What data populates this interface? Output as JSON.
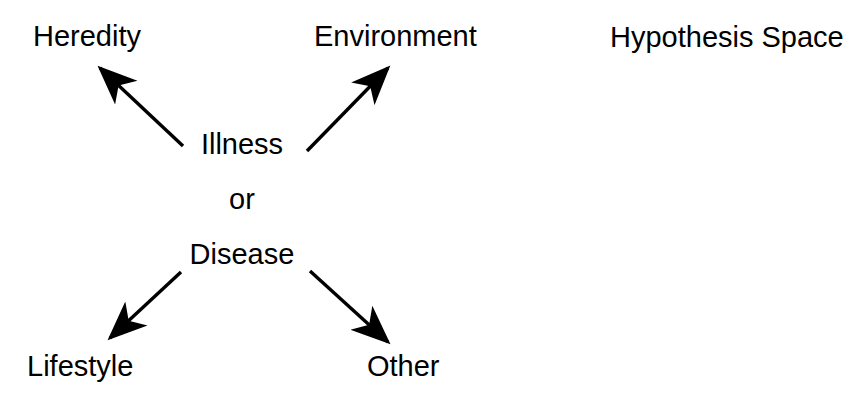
{
  "diagram": {
    "title": "Hypothesis Space",
    "background_color": "#ffffff",
    "ink_color": "#000000",
    "center": {
      "line1": "Illness",
      "line2": "or",
      "line3": "Disease"
    },
    "nodes": [
      {
        "id": "heredity",
        "label": "Heredity",
        "position": "top-left"
      },
      {
        "id": "environment",
        "label": "Environment",
        "position": "top-center"
      },
      {
        "id": "hypothesis",
        "label": "Hypothesis Space",
        "position": "top-right"
      },
      {
        "id": "lifestyle",
        "label": "Lifestyle",
        "position": "bottom-left"
      },
      {
        "id": "other",
        "label": "Other",
        "position": "bottom-right"
      }
    ],
    "arrows": [
      {
        "id": "illness-to-heredity",
        "from": "Illness or Disease",
        "to": "Heredity",
        "direction": "up-left",
        "x1": 183,
        "y1": 146,
        "x2": 96,
        "y2": 65
      },
      {
        "id": "illness-to-environment",
        "from": "Illness or Disease",
        "to": "Environment",
        "direction": "up-right",
        "x1": 307,
        "y1": 151,
        "x2": 392,
        "y2": 64
      },
      {
        "id": "disease-to-lifestyle",
        "from": "Illness or Disease",
        "to": "Lifestyle",
        "direction": "down-left",
        "x1": 181,
        "y1": 272,
        "x2": 106,
        "y2": 342
      },
      {
        "id": "disease-to-other",
        "from": "Illness or Disease",
        "to": "Other",
        "direction": "down-right",
        "x1": 310,
        "y1": 271,
        "x2": 392,
        "y2": 346
      }
    ]
  }
}
